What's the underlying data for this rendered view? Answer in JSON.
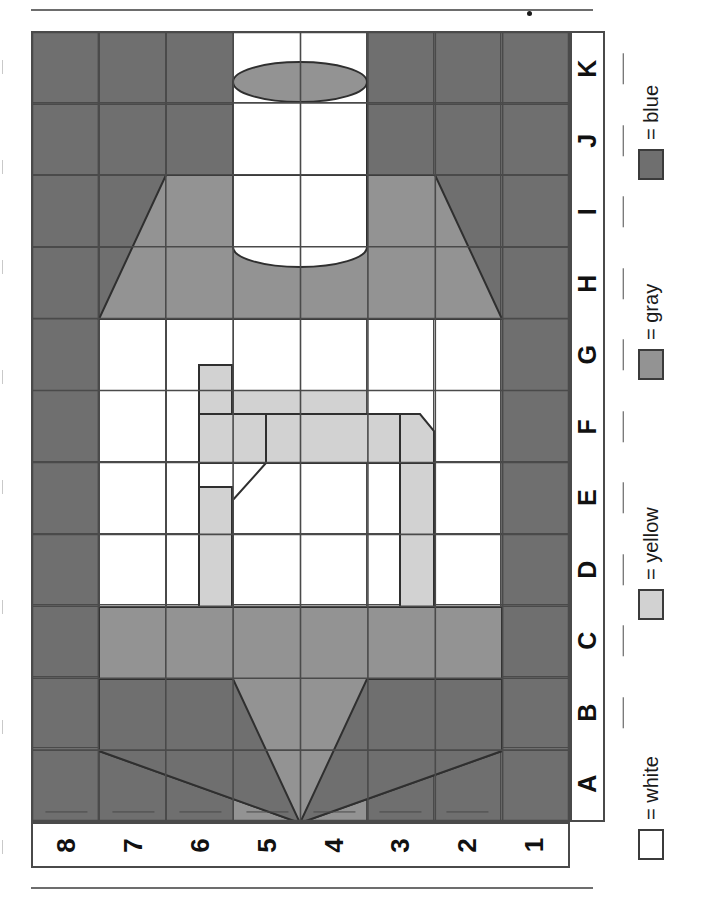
{
  "worksheet": {
    "grid": {
      "row_labels": [
        "K",
        "J",
        "I",
        "H",
        "G",
        "F",
        "E",
        "D",
        "C",
        "B",
        "A"
      ],
      "col_labels": [
        "8",
        "7",
        "6",
        "5",
        "4",
        "3",
        "2",
        "1"
      ],
      "rows": 11,
      "cols": 8,
      "cells": [
        [
          "blue",
          "blue",
          "blue",
          "white",
          "white",
          "blue",
          "blue",
          "blue"
        ],
        [
          "blue",
          "blue",
          "blue",
          "white",
          "white",
          "blue",
          "blue",
          "blue"
        ],
        [
          "blue",
          "blue",
          "blue",
          "white",
          "white",
          "blue",
          "blue",
          "blue"
        ],
        [
          "blue",
          "blue",
          "gray",
          "gray",
          "gray",
          "gray",
          "blue",
          "blue"
        ],
        [
          "blue",
          "white",
          "white",
          "white",
          "white",
          "white",
          "white",
          "blue"
        ],
        [
          "blue",
          "white",
          "white",
          "yellow",
          "yellow",
          "white",
          "white",
          "blue"
        ],
        [
          "blue",
          "white",
          "white",
          "white",
          "white",
          "white",
          "white",
          "blue"
        ],
        [
          "blue",
          "white",
          "white",
          "white",
          "white",
          "white",
          "white",
          "blue"
        ],
        [
          "blue",
          "white",
          "white",
          "white",
          "white",
          "white",
          "white",
          "blue"
        ],
        [
          "blue",
          "gray",
          "gray",
          "gray",
          "gray",
          "gray",
          "gray",
          "blue"
        ],
        [
          "blue",
          "blue",
          "blue",
          "gray",
          "gray",
          "blue",
          "blue",
          "blue"
        ]
      ]
    },
    "legend": {
      "title": "color key",
      "items": [
        {
          "swatch": "white",
          "label": "= white",
          "color": "#ffffff"
        },
        {
          "swatch": "yellow",
          "label": "= yellow",
          "color": "#d2d2d2"
        },
        {
          "swatch": "gray",
          "label": "= gray",
          "color": "#939393"
        },
        {
          "swatch": "blue",
          "label": "= blue",
          "color": "#6f6f6f"
        }
      ]
    },
    "colors": {
      "blue": "#6f6f6f",
      "gray": "#939393",
      "yellow": "#d2d2d2",
      "white": "#ffffff",
      "line": "#4a4a4a",
      "rule": "#6d6d6d"
    }
  }
}
